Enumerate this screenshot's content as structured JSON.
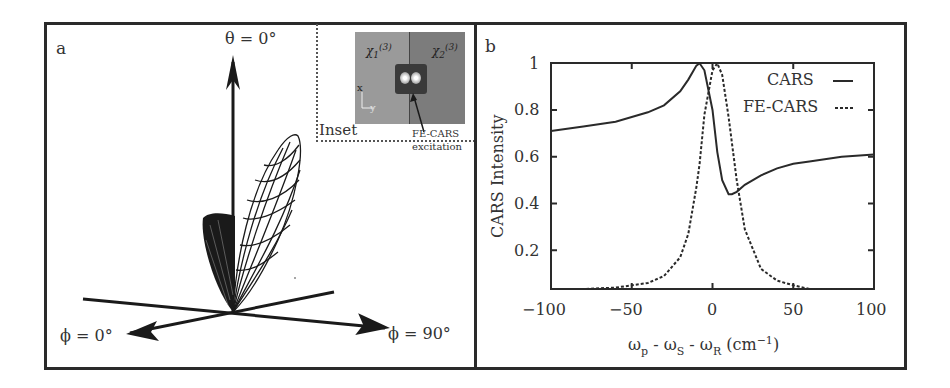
{
  "figure": {
    "panel_a": {
      "label": "a",
      "theta_label": "θ = 0°",
      "phi0_label": "ϕ = 0°",
      "phi90_label": "ϕ = 90°",
      "inset": {
        "label": "Inset",
        "chi1": "χ",
        "chi1_sub": "1",
        "chi1_sup": "(3)",
        "chi2": "χ",
        "chi2_sub": "2",
        "chi2_sup": "(3)",
        "axis_x": "x",
        "axis_y": "y",
        "annotation_line1": "FE-CARS",
        "annotation_line2": "excitation"
      }
    },
    "panel_b": {
      "label": "b"
    }
  },
  "chart_data": {
    "type": "line",
    "title": "",
    "xlabel": "ωp - ωS - ωR (cm−1)",
    "xlabel_parts": {
      "w1": "ω",
      "s1": "p",
      "sep1": " - ω",
      "s2": "S",
      "sep2": " - ω",
      "s3": "R",
      "unit": " (cm",
      "sup": "−1",
      "close": ")"
    },
    "ylabel": "CARS Intensity",
    "xlim": [
      -100,
      100
    ],
    "ylim": [
      0.03,
      1.0
    ],
    "x_ticks": [
      "−100",
      "−50",
      "0",
      "50",
      "100"
    ],
    "y_ticks": [
      "0.2",
      "0.4",
      "0.6",
      "0.8",
      "1"
    ],
    "grid": false,
    "legend_position": "top-right",
    "legend": [
      "CARS",
      "FE-CARS"
    ],
    "x": [
      -100,
      -80,
      -60,
      -40,
      -30,
      -20,
      -15,
      -10,
      -8,
      -5,
      0,
      3,
      6,
      10,
      12,
      15,
      20,
      30,
      40,
      50,
      60,
      80,
      100
    ],
    "series": [
      {
        "name": "CARS",
        "style": "solid",
        "values": [
          0.71,
          0.73,
          0.75,
          0.79,
          0.82,
          0.88,
          0.93,
          0.99,
          1.0,
          0.97,
          0.8,
          0.62,
          0.5,
          0.44,
          0.44,
          0.45,
          0.48,
          0.52,
          0.55,
          0.57,
          0.58,
          0.6,
          0.61
        ]
      },
      {
        "name": "FE-CARS",
        "style": "dashed",
        "values": [
          0.02,
          0.03,
          0.04,
          0.06,
          0.09,
          0.17,
          0.27,
          0.47,
          0.57,
          0.78,
          0.97,
          1.0,
          0.95,
          0.77,
          0.66,
          0.5,
          0.29,
          0.12,
          0.07,
          0.05,
          0.03,
          0.02,
          0.02
        ]
      }
    ],
    "colors": {
      "line": "#2a2a2a"
    }
  }
}
